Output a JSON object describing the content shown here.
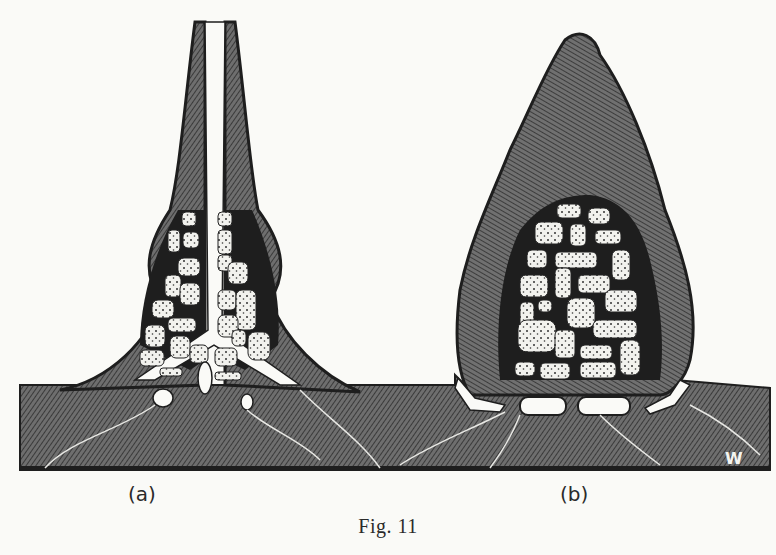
{
  "figure": {
    "caption": "Fig. 11",
    "panels": [
      {
        "id": "a",
        "label": "(a)"
      },
      {
        "id": "b",
        "label": "(b)"
      }
    ],
    "signature": "W",
    "colors": {
      "background": "#fafaf7",
      "hatch": "#5a5a5a",
      "dark": "#1e1e1e",
      "cell": "#f2f2ee"
    }
  }
}
